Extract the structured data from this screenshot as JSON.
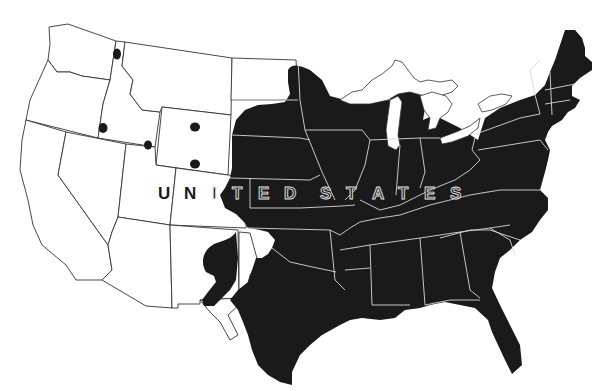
{
  "map": {
    "title": "",
    "country_label_letters": [
      "U",
      "N",
      "I",
      "T",
      "E",
      "D",
      "S",
      "T",
      "A",
      "T",
      "E",
      "S"
    ],
    "country_label": "UNITED STATES",
    "colors": {
      "background": "#ffffff",
      "range_fill": "#1a1a1a",
      "state_border_outside": "#333333",
      "state_border_inside": "#d8d8d8"
    },
    "legend": [],
    "occurrence_points": [
      {
        "state": "Idaho (north)",
        "x": 117,
        "y": 54
      },
      {
        "state": "Oregon/Idaho border",
        "x": 102,
        "y": 128
      },
      {
        "state": "Idaho (southeast)",
        "x": 148,
        "y": 144
      },
      {
        "state": "Wyoming (north)",
        "x": 195,
        "y": 127
      },
      {
        "state": "Wyoming (south)",
        "x": 195,
        "y": 164
      }
    ]
  }
}
